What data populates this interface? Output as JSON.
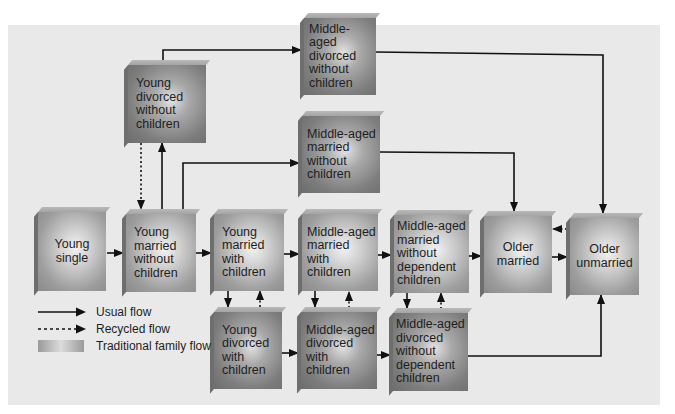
{
  "diagram": {
    "type": "flowchart",
    "colors": {
      "panel_bg": "#e9e9e9",
      "box_face": "#a0a0a0",
      "box_highlight": "#f0f0f0",
      "line": "#111111"
    },
    "nodes": {
      "young_single": "Young\nsingle",
      "young_married_no_children": "Young\nmarried\nwithout\nchildren",
      "young_divorced_no_children": "Young\ndivorced\nwithout\nchildren",
      "young_married_with_children": "Young\nmarried\nwith\nchildren",
      "young_divorced_with_children": "Young\ndivorced\nwith\nchildren",
      "middle_divorced_no_children": "Middle-aged\ndivorced\nwithout\nchildren",
      "middle_married_no_children": "Middle-aged\nmarried\nwithout\nchildren",
      "middle_married_with_children": "Middle-aged\nmarried\nwith\nchildren",
      "middle_divorced_with_children": "Middle-aged\ndivorced\nwith\nchildren",
      "middle_married_no_dependent": "Middle-aged\nmarried\nwithout\ndependent\nchildren",
      "middle_divorced_no_dependent": "Middle-aged\ndivorced\nwithout\ndependent\nchildren",
      "older_married": "Older\nmarried",
      "older_unmarried": "Older\nunmarried"
    },
    "edges": [
      {
        "from": "young_single",
        "to": "young_married_no_children",
        "style": "usual"
      },
      {
        "from": "young_married_no_children",
        "to": "young_married_with_children",
        "style": "usual"
      },
      {
        "from": "young_married_no_children",
        "to": "young_divorced_no_children",
        "style": "usual"
      },
      {
        "from": "young_divorced_no_children",
        "to": "young_married_no_children",
        "style": "recycled"
      },
      {
        "from": "young_married_no_children",
        "to": "middle_married_no_children",
        "style": "usual"
      },
      {
        "from": "young_divorced_no_children",
        "to": "middle_divorced_no_children",
        "style": "usual"
      },
      {
        "from": "young_married_with_children",
        "to": "middle_married_with_children",
        "style": "usual"
      },
      {
        "from": "young_married_with_children",
        "to": "young_divorced_with_children",
        "style": "usual"
      },
      {
        "from": "young_divorced_with_children",
        "to": "young_married_with_children",
        "style": "recycled"
      },
      {
        "from": "young_divorced_with_children",
        "to": "middle_divorced_with_children",
        "style": "usual"
      },
      {
        "from": "middle_married_with_children",
        "to": "middle_married_no_dependent",
        "style": "usual"
      },
      {
        "from": "middle_married_with_children",
        "to": "middle_divorced_with_children",
        "style": "usual"
      },
      {
        "from": "middle_divorced_with_children",
        "to": "middle_married_with_children",
        "style": "recycled"
      },
      {
        "from": "middle_divorced_with_children",
        "to": "middle_divorced_no_dependent",
        "style": "usual"
      },
      {
        "from": "middle_married_no_dependent",
        "to": "older_married",
        "style": "usual"
      },
      {
        "from": "middle_married_no_dependent",
        "to": "middle_divorced_no_dependent",
        "style": "usual"
      },
      {
        "from": "middle_divorced_no_dependent",
        "to": "middle_married_no_dependent",
        "style": "recycled"
      },
      {
        "from": "middle_divorced_no_dependent",
        "to": "older_unmarried",
        "style": "usual"
      },
      {
        "from": "middle_married_no_children",
        "to": "older_married",
        "style": "usual"
      },
      {
        "from": "middle_divorced_no_children",
        "to": "older_unmarried",
        "style": "usual"
      },
      {
        "from": "older_married",
        "to": "older_unmarried",
        "style": "usual"
      },
      {
        "from": "older_unmarried",
        "to": "older_married",
        "style": "recycled"
      }
    ],
    "legend": {
      "usual": "Usual flow",
      "recycled": "Recycled flow",
      "traditional": "Traditional family flow"
    }
  }
}
